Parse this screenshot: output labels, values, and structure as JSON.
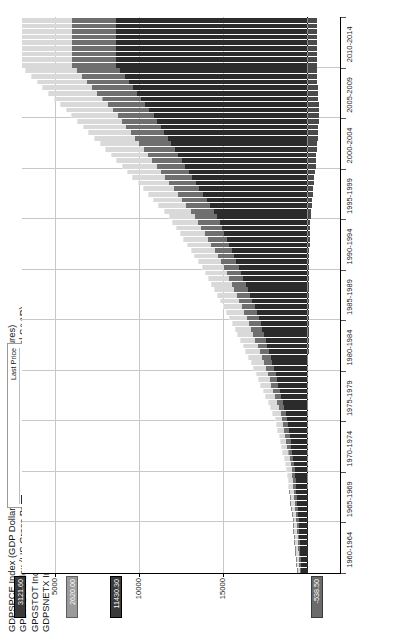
{
  "chart_data": {
    "type": "bar",
    "subtitle": "",
    "xlabel": "",
    "ylabel": "",
    "grid": true,
    "legend_position": "top-left",
    "orientation": "vertical-stacked-rotated",
    "ylim": [
      -2000,
      17000
    ],
    "y_ticks": [
      5000,
      10000,
      15000
    ],
    "y_tick_labels": [
      "5000",
      "10000",
      "15000"
    ],
    "categories": [
      "1960-1964",
      "1965-1969",
      "1970-1974",
      "1975-1979",
      "1980-1984",
      "1985-1989",
      "1990-1994",
      "1995-1999",
      "2000-2004",
      "2005-2009",
      "2010-2014"
    ],
    "series": [
      {
        "name": "GDPSPCE Index",
        "color": "#2b2b2b",
        "values": [
          380,
          530,
          770,
          1210,
          2000,
          2900,
          4100,
          5400,
          7300,
          9200,
          11430
        ]
      },
      {
        "name": "GPDITOT Index",
        "color": "#6f6f6f",
        "values": [
          88,
          130,
          185,
          290,
          480,
          720,
          870,
          1330,
          1720,
          2150,
          2620
        ]
      },
      {
        "name": "GPGSTOT Index",
        "color": "#d9d9d9",
        "values": [
          115,
          175,
          250,
          400,
          700,
          1000,
          1300,
          1500,
          2000,
          2700,
          3121
        ]
      },
      {
        "name": "GDPSNETX Index",
        "color": "#4a4a4a",
        "values": [
          4,
          3,
          -2,
          -12,
          -40,
          -110,
          -80,
          -180,
          -480,
          -700,
          -538
        ]
      }
    ]
  },
  "titles": [
    "GDPSPCE Index (GDP Dollar Level Personal Consumption Expenditures)",
    "GPDITOT Index (US Gross Private Domestic Investment Total Nominal SAAR)",
    "GPGSTOT Index (US GDP Govt Purchases & Investment Total Nominal SAAR)",
    "GDPSNETX Index (GDP Dollar Level Net Exports of Goods and Services)"
  ],
  "legend": {
    "header_value": "Last Price",
    "rows": [
      {
        "name": "GDPSPCE Index",
        "value": "11430.30",
        "change": "+51.10",
        "color": "#2b2b2b"
      },
      {
        "name": "GPDITOT Index",
        "value": "2620.00",
        "change": "+64.90",
        "color": "#6f6f6f"
      },
      {
        "name": "GPGSTOT Index",
        "value": "3121.60",
        "change": "-2.50",
        "color": "#d9d9d9"
      },
      {
        "name": "GDPSNETX Index",
        "value": "-538.50",
        "change": "-15.40",
        "color": "#4a4a4a"
      }
    ]
  },
  "y_axis": {
    "ticks": [
      "15000",
      "10000",
      "5000"
    ],
    "badges": [
      {
        "text": "3121.60",
        "style": "dark"
      },
      {
        "text": "2620.00",
        "style": "grey"
      },
      {
        "text": "11430.30",
        "style": "dark"
      },
      {
        "text": "-538.50",
        "style": "mid"
      }
    ]
  },
  "x_axis": {
    "labels": [
      "1960-1964",
      "1965-1969",
      "1970-1974",
      "1975-1979",
      "1980-1984",
      "1985-1989",
      "1990-1994",
      "1995-1999",
      "2000-2004",
      "2005-2009",
      "2010-2014"
    ]
  }
}
